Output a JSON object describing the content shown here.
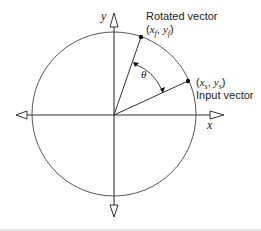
{
  "diagram": {
    "type": "vector-rotation",
    "axes": {
      "x_label": "x",
      "y_label": "y"
    },
    "angle_label": "θ",
    "rotated_vector": {
      "title": "Rotated vector",
      "coords": "(x_f, y_f)",
      "coords_x": "x",
      "coords_x_sub": "f",
      "coords_y": "y",
      "coords_y_sub": "f"
    },
    "input_vector": {
      "title": "Input vector",
      "coords": "(x_s, y_s)",
      "coords_x": "x",
      "coords_x_sub": "s",
      "coords_y": "y",
      "coords_y_sub": "s"
    },
    "colors": {
      "stroke": "#333333",
      "background": "#ffffff"
    }
  }
}
